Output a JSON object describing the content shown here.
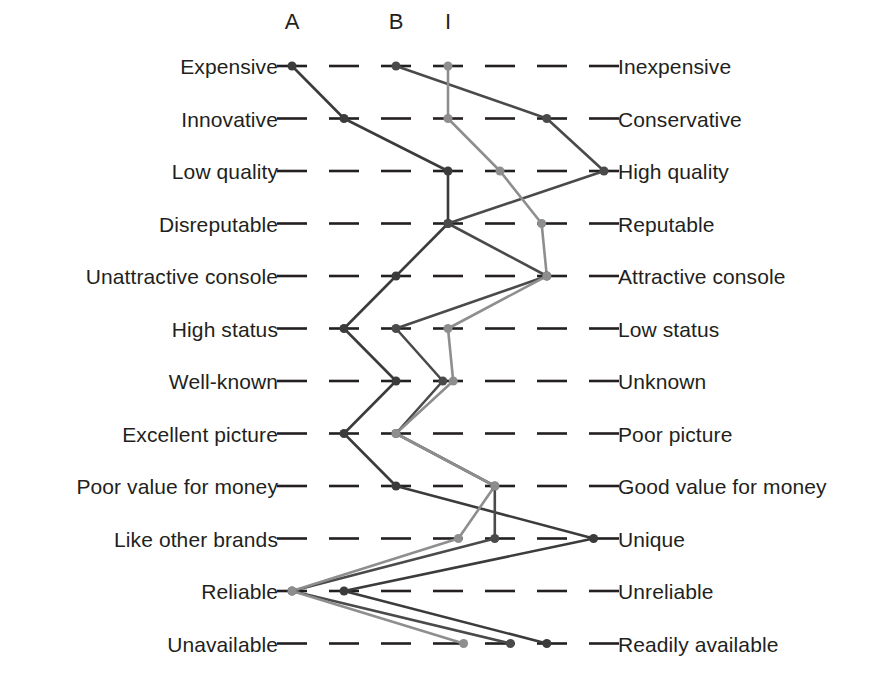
{
  "chart_data": {
    "type": "line",
    "chart_kind": "semantic-differential-profile",
    "title": "",
    "xlabel": "",
    "ylabel": "",
    "scale_points": 7,
    "xlim": [
      1,
      7
    ],
    "grid": "dashed-tick-marks",
    "legend_position": "top",
    "column_headers": [
      {
        "label": "A",
        "scale_position": 1.0
      },
      {
        "label": "B",
        "scale_position": 3.0
      },
      {
        "label": "I",
        "scale_position": 4.0
      }
    ],
    "categories": [
      {
        "left": "Expensive",
        "right": "Inexpensive"
      },
      {
        "left": "Innovative",
        "right": "Conservative"
      },
      {
        "left": "Low quality",
        "right": "High quality"
      },
      {
        "left": "Disreputable",
        "right": "Reputable"
      },
      {
        "left": "Unattractive console",
        "right": "Attractive console"
      },
      {
        "left": "High status",
        "right": "Low status"
      },
      {
        "left": "Well-known",
        "right": "Unknown"
      },
      {
        "left": "Excellent picture",
        "right": "Poor picture"
      },
      {
        "left": "Poor value for money",
        "right": "Good value for money"
      },
      {
        "left": "Like other brands",
        "right": "Unique"
      },
      {
        "left": "Reliable",
        "right": "Unreliable"
      },
      {
        "left": "Unavailable",
        "right": "Readily available"
      }
    ],
    "series": [
      {
        "name": "A",
        "color": "#3b3b3b",
        "values": [
          1.0,
          2.0,
          4.0,
          4.0,
          3.0,
          2.0,
          3.0,
          2.0,
          3.0,
          6.8,
          2.0,
          5.9
        ]
      },
      {
        "name": "B",
        "color": "#4a4a4a",
        "values": [
          3.0,
          5.9,
          7.0,
          4.0,
          5.9,
          3.0,
          3.9,
          3.0,
          4.9,
          4.9,
          1.0,
          5.2
        ]
      },
      {
        "name": "I",
        "color": "#8e8e8e",
        "values": [
          4.0,
          4.0,
          5.0,
          5.8,
          5.9,
          4.0,
          4.1,
          3.0,
          4.9,
          4.2,
          1.0,
          4.3
        ]
      }
    ]
  },
  "geometry": {
    "scale_x_start": 292,
    "scale_x_end": 604,
    "row_y_start": 66,
    "row_y_step": 52.5,
    "left_label_x": 278,
    "right_label_x": 618,
    "header_y": 22,
    "tick_dash_length": 30,
    "point_radius": 4.5
  }
}
